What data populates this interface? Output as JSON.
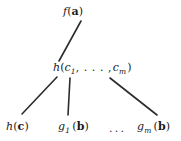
{
  "diagram": {
    "type": "tree",
    "background_color": "#ffffff",
    "line_color": "#2b2b2b",
    "text_color": "#1a1a1a",
    "nodes": [
      {
        "id": "root",
        "label": "f(a)",
        "function": "f",
        "arg": "a",
        "level": 0
      },
      {
        "id": "mid",
        "label": "h(c_1,...,c_m)",
        "function": "h",
        "first_subscript": "1",
        "last_subscript": "m",
        "var": "c",
        "level": 1
      },
      {
        "id": "leaf-hc",
        "label": "h(c)",
        "function": "h",
        "arg": "c",
        "level": 2
      },
      {
        "id": "leaf-g1",
        "label": "g_1(b)",
        "function": "g",
        "subscript": "1",
        "arg": "b",
        "level": 2
      },
      {
        "id": "leaf-gm",
        "label": "g_m(b)",
        "function": "g",
        "subscript": "m",
        "arg": "b",
        "level": 2
      }
    ],
    "ellipsis": "...",
    "edges": [
      {
        "from": "root",
        "to": "mid",
        "x1": 81,
        "y1": 21,
        "x2": 59,
        "y2": 61
      },
      {
        "from": "mid",
        "to": "leaf-hc",
        "x1": 57,
        "y1": 77,
        "x2": 22,
        "y2": 114
      },
      {
        "from": "mid",
        "to": "leaf-g1",
        "x1": 70,
        "y1": 78,
        "x2": 68,
        "y2": 115
      },
      {
        "from": "mid",
        "to": "leaf-gm",
        "x1": 110,
        "y1": 78,
        "x2": 157,
        "y2": 115
      }
    ]
  }
}
